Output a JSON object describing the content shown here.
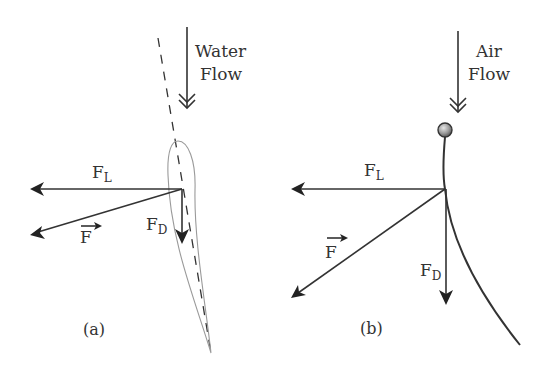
{
  "figure": {
    "panels": [
      {
        "id": "a",
        "label": "(a)",
        "flow": {
          "line1": "Water",
          "line2": "Flow"
        },
        "forces": {
          "lift": {
            "symbol": "F",
            "subscript": "L"
          },
          "drag": {
            "symbol": "F",
            "subscript": "D"
          },
          "resultant": {
            "symbol": "F",
            "vector_mark": "→"
          }
        },
        "body": "hydrofoil with dashed chord line"
      },
      {
        "id": "b",
        "label": "(b)",
        "flow": {
          "line1": "Air",
          "line2": "Flow"
        },
        "forces": {
          "lift": {
            "symbol": "F",
            "subscript": "L"
          },
          "drag": {
            "symbol": "F",
            "subscript": "D"
          },
          "resultant": {
            "symbol": "F",
            "vector_mark": "→"
          }
        },
        "body": "flexible curved stem with ball at top"
      }
    ],
    "colors": {
      "ink": "#333333",
      "foil_outline": "#9a9a9a",
      "ball": "#999999"
    }
  }
}
